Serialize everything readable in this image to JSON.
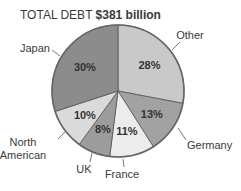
{
  "chart_data": {
    "type": "pie",
    "title": "TOTAL DEBT $381 billion",
    "title_prefix": "TOTAL DEBT",
    "title_value": "$381 billion",
    "slices": [
      {
        "label": "Other",
        "value": 28,
        "display": "28%",
        "color": "#c9c9c9"
      },
      {
        "label": "Germany",
        "value": 13,
        "display": "13%",
        "color": "#a2a2a2"
      },
      {
        "label": "France",
        "value": 11,
        "display": "11%",
        "color": "#ececec"
      },
      {
        "label": "UK",
        "value": 8,
        "display": "8%",
        "color": "#9c9c9c"
      },
      {
        "label": "North American",
        "value": 10,
        "display": "10%",
        "color": "#dadada"
      },
      {
        "label": "Japan",
        "value": 30,
        "display": "30%",
        "color": "#8c8c8c"
      }
    ],
    "legend": "none (callout labels)"
  }
}
